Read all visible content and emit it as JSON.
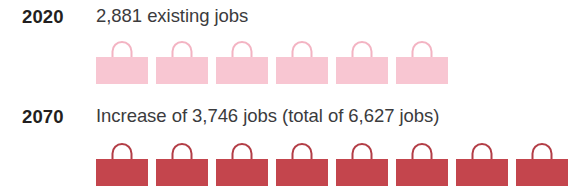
{
  "chart_data": {
    "type": "bar",
    "title": "",
    "subtitle": "",
    "xlabel": "",
    "ylabel": "",
    "unit_note": "Each bag icon represents approximately 480 jobs",
    "icon_glyph": "shopping-bag-icon",
    "grid": false,
    "legend_position": "none",
    "categories": [
      "2020",
      "2070"
    ],
    "series": [
      {
        "name": "Jobs",
        "values": [
          2881,
          6627
        ],
        "icon_counts": [
          6,
          8
        ]
      }
    ],
    "annotations": [
      "2020: 2,881 existing jobs",
      "2070: Increase of 3,746 jobs (total of 6,627 jobs)"
    ]
  },
  "colors": {
    "background": "#ffffff",
    "year_text": "#231f20",
    "body_text": "#3b3b3d",
    "bag_2020_fill": "#f8c6d2",
    "bag_2020_handle": "#f3b4c3",
    "bag_2070_fill": "#c4454d",
    "bag_2070_handle": "#b33d46"
  },
  "rows": [
    {
      "year": "2020",
      "text": "2,881 existing jobs",
      "icon_count": 6,
      "icon_name": "shopping-bag-icon-light",
      "value": 2881
    },
    {
      "year": "2070",
      "text": "Increase of 3,746 jobs (total of 6,627 jobs)",
      "icon_count": 8,
      "icon_name": "shopping-bag-icon-dark",
      "value": 6627
    }
  ]
}
